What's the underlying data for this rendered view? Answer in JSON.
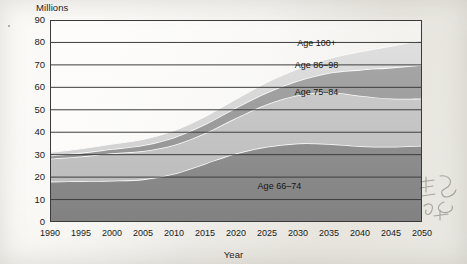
{
  "chart_data": {
    "type": "area",
    "title": "",
    "subtitle": "",
    "xlabel": "Year",
    "ylabel": "Millions",
    "stacked": true,
    "grid": true,
    "legend_position": "inline-annotations",
    "xlim": [
      1990,
      2050
    ],
    "ylim": [
      0,
      90
    ],
    "x": [
      1990,
      1995,
      2000,
      2005,
      2010,
      2015,
      2020,
      2025,
      2030,
      2035,
      2040,
      2045,
      2050
    ],
    "xticks": [
      "1990",
      "1995",
      "2000",
      "2005",
      "2010",
      "2015",
      "2020",
      "2025",
      "2030",
      "2035",
      "2040",
      "2045",
      "2050"
    ],
    "yticks": [
      "0",
      "10",
      "20",
      "30",
      "40",
      "50",
      "60",
      "70",
      "80",
      "90"
    ],
    "series": [
      {
        "name": "Age 66–74",
        "color": "#8a8a8a",
        "values": [
          18.0,
          18.2,
          18.4,
          19.0,
          21.5,
          26.0,
          30.5,
          33.5,
          35.0,
          34.8,
          33.8,
          33.5,
          34.0
        ]
      },
      {
        "name": "Age 75–84",
        "color": "#c4c4c4",
        "values": [
          10.2,
          11.0,
          12.2,
          12.6,
          12.8,
          13.5,
          15.8,
          19.0,
          21.5,
          23.0,
          22.5,
          21.5,
          21.0
        ]
      },
      {
        "name": "Age 86–98",
        "color": "#9e9e9e",
        "values": [
          1.4,
          1.6,
          1.9,
          2.6,
          3.4,
          4.0,
          4.6,
          5.2,
          6.4,
          8.6,
          11.5,
          13.8,
          15.0
        ]
      },
      {
        "name": "Age 100+",
        "color": "#dcdcdc",
        "values": [
          1.4,
          1.8,
          2.2,
          2.6,
          3.0,
          3.4,
          3.8,
          4.5,
          5.3,
          6.4,
          8.0,
          9.5,
          11.0
        ]
      }
    ],
    "annotations": [
      {
        "text": "Age 100+",
        "x": 2033,
        "y": 79.5
      },
      {
        "text": "Age 86–98",
        "x": 2033,
        "y": 69.5
      },
      {
        "text": "Age 75–84",
        "x": 2033,
        "y": 57.5
      },
      {
        "text": "Age 66–74",
        "x": 2027,
        "y": 15.5
      }
    ]
  },
  "figure": {
    "y_axis_title": "Millions",
    "x_axis_title": "Year"
  }
}
